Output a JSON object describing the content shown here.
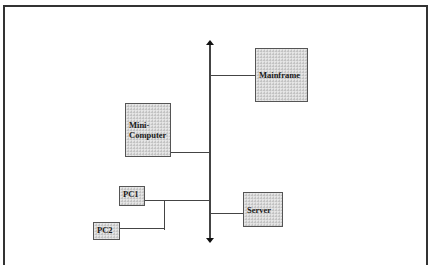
{
  "diagram": {
    "type": "bus-network-topology",
    "backbone": {
      "orientation": "vertical",
      "arrows": [
        "up",
        "down"
      ]
    },
    "nodes": [
      {
        "id": "mainframe",
        "label": "Mainframe"
      },
      {
        "id": "minicomputer",
        "label": "Mini-\nComputer"
      },
      {
        "id": "pc1",
        "label": "PC1"
      },
      {
        "id": "pc2",
        "label": "PC2"
      },
      {
        "id": "server",
        "label": "Server"
      }
    ],
    "edges": [
      {
        "from": "mainframe",
        "to": "backbone"
      },
      {
        "from": "minicomputer",
        "to": "backbone"
      },
      {
        "from": "pc1",
        "to": "backbone"
      },
      {
        "from": "pc2",
        "to": "pc1-branch"
      },
      {
        "from": "server",
        "to": "backbone"
      }
    ],
    "colors": {
      "node_fill": "#d9d9d9",
      "node_border": "#555555",
      "line": "#444444",
      "arrow": "#111111",
      "frame": "#333333"
    }
  }
}
